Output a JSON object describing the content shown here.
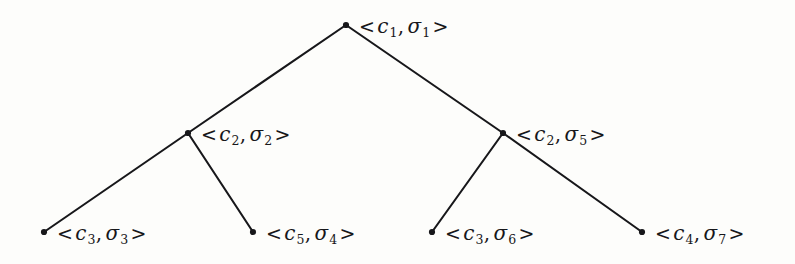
{
  "figure": {
    "type": "binary-tree-diagram",
    "background_color": "#fdfdfb",
    "line_color": "#17171a",
    "text_color": "#17171a",
    "width": 795,
    "height": 264,
    "bracket_open": "<",
    "bracket_close": ">",
    "separator": ","
  },
  "nodes": [
    {
      "id": "root",
      "level": 0,
      "x": 346,
      "y": 25,
      "config": "c",
      "config_index": "1",
      "state": "σ",
      "state_index": "1",
      "label": "< c1, σ1 >"
    },
    {
      "id": "inner-left",
      "level": 1,
      "x": 188,
      "y": 133,
      "config": "c",
      "config_index": "2",
      "state": "σ",
      "state_index": "2",
      "label": "< c2, σ2 >"
    },
    {
      "id": "inner-right",
      "level": 1,
      "x": 503,
      "y": 133,
      "config": "c",
      "config_index": "2",
      "state": "σ",
      "state_index": "5",
      "label": "< c2, σ5 >"
    },
    {
      "id": "leaf-1",
      "level": 2,
      "x": 44,
      "y": 232,
      "config": "c",
      "config_index": "3",
      "state": "σ",
      "state_index": "3",
      "label": "< c3, σ3 >"
    },
    {
      "id": "leaf-2",
      "level": 2,
      "x": 253,
      "y": 232,
      "config": "c",
      "config_index": "5",
      "state": "σ",
      "state_index": "4",
      "label": "< c5, σ4 >"
    },
    {
      "id": "leaf-3",
      "level": 2,
      "x": 432,
      "y": 232,
      "config": "c",
      "config_index": "3",
      "state": "σ",
      "state_index": "6",
      "label": "< c3, σ6 >"
    },
    {
      "id": "leaf-4",
      "level": 2,
      "x": 642,
      "y": 232,
      "config": "c",
      "config_index": "4",
      "state": "σ",
      "state_index": "7",
      "label": "< c4, σ7 >"
    }
  ],
  "edges": [
    {
      "id": "root-to-inner-left",
      "from": "root",
      "to": "inner-left"
    },
    {
      "id": "root-to-inner-right",
      "from": "root",
      "to": "inner-right"
    },
    {
      "id": "inner-left-to-leaf-1",
      "from": "inner-left",
      "to": "leaf-1"
    },
    {
      "id": "inner-left-to-leaf-2",
      "from": "inner-left",
      "to": "leaf-2"
    },
    {
      "id": "inner-right-to-leaf-3",
      "from": "inner-right",
      "to": "leaf-3"
    },
    {
      "id": "inner-right-to-leaf-4",
      "from": "inner-right",
      "to": "leaf-4"
    }
  ]
}
